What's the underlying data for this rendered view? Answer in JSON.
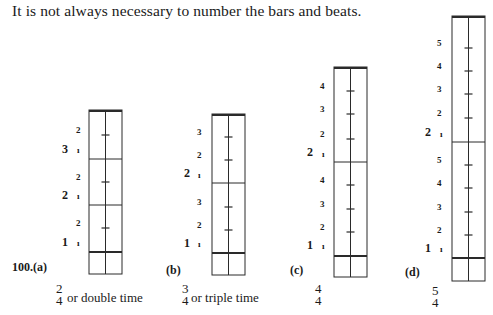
{
  "intro_text": "It is not always necessary to number the bars and beats.",
  "example_number": "100.",
  "diagrams": [
    {
      "id": "a",
      "label": "(a)",
      "time_signature": {
        "top": "2",
        "bottom": "4"
      },
      "description": "or double time",
      "box": {
        "left": 89,
        "right": 122,
        "top": 110,
        "bottom": 274,
        "downbeat_y": 252
      },
      "bar_lines_y": [
        159,
        205
      ],
      "tick_y": [
        135,
        182,
        228
      ],
      "bars": [
        {
          "number": "1",
          "beat_labels": [
            "ı",
            "2"
          ]
        },
        {
          "number": "2",
          "beat_labels": [
            "ı",
            "2"
          ]
        },
        {
          "number": "3",
          "beat_labels": [
            "ı",
            "2"
          ]
        }
      ],
      "labels": [
        {
          "text": "1",
          "x": 62,
          "y": 242,
          "kind": "bar"
        },
        {
          "text": "ı",
          "x": 77,
          "y": 243,
          "kind": "beat"
        },
        {
          "text": "2",
          "x": 76,
          "y": 223,
          "kind": "beat"
        },
        {
          "text": "2",
          "x": 62,
          "y": 195,
          "kind": "bar"
        },
        {
          "text": "ı",
          "x": 77,
          "y": 196,
          "kind": "beat"
        },
        {
          "text": "2",
          "x": 76,
          "y": 177,
          "kind": "beat"
        },
        {
          "text": "3",
          "x": 62,
          "y": 149,
          "kind": "bar"
        },
        {
          "text": "ı",
          "x": 77,
          "y": 150,
          "kind": "beat"
        },
        {
          "text": "2",
          "x": 76,
          "y": 130,
          "kind": "beat"
        }
      ]
    },
    {
      "id": "b",
      "label": "(b)",
      "time_signature": {
        "top": "3",
        "bottom": "4"
      },
      "description": "or triple time",
      "box": {
        "left": 212,
        "right": 245,
        "top": 114,
        "bottom": 275,
        "downbeat_y": 253
      },
      "bar_lines_y": [
        183
      ],
      "tick_y": [
        137,
        160,
        207,
        230
      ],
      "bars": [
        {
          "number": "1",
          "beat_labels": [
            "ı",
            "2",
            "3"
          ]
        },
        {
          "number": "2",
          "beat_labels": [
            "ı",
            "2",
            "3"
          ]
        }
      ],
      "labels": [
        {
          "text": "1",
          "x": 184,
          "y": 243,
          "kind": "bar"
        },
        {
          "text": "ı",
          "x": 198,
          "y": 244,
          "kind": "beat"
        },
        {
          "text": "2",
          "x": 197,
          "y": 225,
          "kind": "beat"
        },
        {
          "text": "3",
          "x": 197,
          "y": 202,
          "kind": "beat"
        },
        {
          "text": "2",
          "x": 184,
          "y": 173,
          "kind": "bar"
        },
        {
          "text": "ı",
          "x": 198,
          "y": 175,
          "kind": "beat"
        },
        {
          "text": "2",
          "x": 197,
          "y": 155,
          "kind": "beat"
        },
        {
          "text": "3",
          "x": 197,
          "y": 132,
          "kind": "beat"
        }
      ]
    },
    {
      "id": "c",
      "label": "(c)",
      "time_signature": {
        "top": "4",
        "bottom": "4"
      },
      "description": "",
      "box": {
        "left": 334,
        "right": 367,
        "top": 67,
        "bottom": 277,
        "downbeat_y": 256
      },
      "bar_lines_y": [
        162
      ],
      "tick_y": [
        91,
        114,
        139,
        185,
        209,
        232
      ],
      "bars": [
        {
          "number": "1",
          "beat_labels": [
            "ı",
            "2",
            "3",
            "4"
          ]
        },
        {
          "number": "2",
          "beat_labels": [
            "ı",
            "2",
            "3",
            "4"
          ]
        }
      ],
      "labels": [
        {
          "text": "1",
          "x": 307,
          "y": 245,
          "kind": "bar"
        },
        {
          "text": "ı",
          "x": 322,
          "y": 246,
          "kind": "beat"
        },
        {
          "text": "2",
          "x": 320,
          "y": 227,
          "kind": "beat"
        },
        {
          "text": "3",
          "x": 320,
          "y": 204,
          "kind": "beat"
        },
        {
          "text": "4",
          "x": 320,
          "y": 180,
          "kind": "beat"
        },
        {
          "text": "2",
          "x": 307,
          "y": 152,
          "kind": "bar"
        },
        {
          "text": "ı",
          "x": 322,
          "y": 154,
          "kind": "beat"
        },
        {
          "text": "2",
          "x": 320,
          "y": 134,
          "kind": "beat"
        },
        {
          "text": "3",
          "x": 320,
          "y": 109,
          "kind": "beat"
        },
        {
          "text": "4",
          "x": 320,
          "y": 86,
          "kind": "beat"
        }
      ]
    },
    {
      "id": "d",
      "label": "(d)",
      "time_signature": {
        "top": "5",
        "bottom": "4"
      },
      "description": "",
      "box": {
        "left": 452,
        "right": 485,
        "top": 16,
        "bottom": 281,
        "downbeat_y": 258
      },
      "bar_lines_y": [
        142
      ],
      "tick_y": [
        48,
        71,
        94,
        118,
        165,
        188,
        212,
        235
      ],
      "bars": [
        {
          "number": "1",
          "beat_labels": [
            "ı",
            "2",
            "3",
            "4",
            "5"
          ]
        },
        {
          "number": "2",
          "beat_labels": [
            "ı",
            "2",
            "3",
            "4",
            "5"
          ]
        }
      ],
      "labels": [
        {
          "text": "1",
          "x": 425,
          "y": 248,
          "kind": "bar"
        },
        {
          "text": "ı",
          "x": 440,
          "y": 249,
          "kind": "beat"
        },
        {
          "text": "2",
          "x": 437,
          "y": 230,
          "kind": "beat"
        },
        {
          "text": "3",
          "x": 437,
          "y": 207,
          "kind": "beat"
        },
        {
          "text": "4",
          "x": 437,
          "y": 183,
          "kind": "beat"
        },
        {
          "text": "5",
          "x": 437,
          "y": 160,
          "kind": "beat"
        },
        {
          "text": "2",
          "x": 425,
          "y": 132,
          "kind": "bar"
        },
        {
          "text": "ı",
          "x": 440,
          "y": 134,
          "kind": "beat"
        },
        {
          "text": "2",
          "x": 437,
          "y": 113,
          "kind": "beat"
        },
        {
          "text": "3",
          "x": 437,
          "y": 89,
          "kind": "beat"
        },
        {
          "text": "4",
          "x": 437,
          "y": 66,
          "kind": "beat"
        },
        {
          "text": "5",
          "x": 437,
          "y": 43,
          "kind": "beat"
        }
      ]
    }
  ]
}
